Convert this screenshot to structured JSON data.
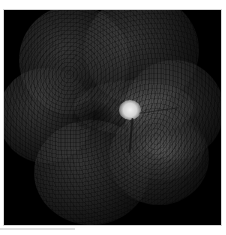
{
  "image": {
    "description": "Wide-field retinal fundus montage, grayscale",
    "background_color": "#000000",
    "page_background": "#ffffff",
    "optic_disc": {
      "x": 129,
      "y": 110,
      "color": "#e8e8e8"
    },
    "lobes": [
      {
        "name": "superior-left",
        "cx": 70,
        "cy": 60,
        "r": 55
      },
      {
        "name": "superior-right",
        "cx": 140,
        "cy": 50,
        "r": 55
      },
      {
        "name": "temporal-left",
        "cx": 42,
        "cy": 115,
        "r": 45
      },
      {
        "name": "nasal-right",
        "cx": 175,
        "cy": 110,
        "r": 50
      },
      {
        "name": "inferior-left",
        "cx": 90,
        "cy": 170,
        "r": 55
      },
      {
        "name": "inferior-right",
        "cx": 160,
        "cy": 160,
        "r": 50
      }
    ]
  }
}
